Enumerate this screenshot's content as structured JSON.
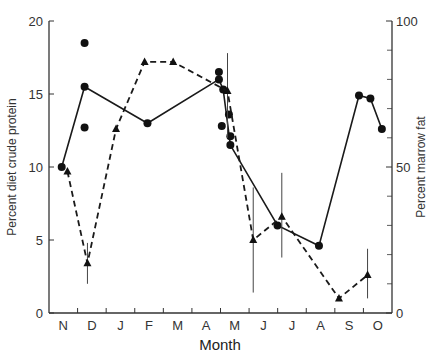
{
  "chart_data": {
    "type": "line",
    "title": "",
    "xlabel": "Month",
    "ylabel_left": "Percent diet crude protein",
    "ylabel_right": "Percent marrow fat",
    "ylim_left": [
      0,
      20
    ],
    "ylim_right": [
      0,
      100
    ],
    "yticks_left": [
      0,
      5,
      10,
      15,
      20
    ],
    "yticks_right": [
      0,
      50,
      100
    ],
    "yticks_right_minor": [
      10,
      20,
      30,
      40,
      60,
      70,
      80,
      90
    ],
    "categories": [
      "N",
      "D",
      "J",
      "F",
      "M",
      "A",
      "M",
      "J",
      "J",
      "A",
      "S",
      "O"
    ],
    "grid": false,
    "legend": "none",
    "series": [
      {
        "name": "Percent diet crude protein",
        "axis": "left",
        "style": "solid",
        "marker": "circle",
        "points": [
          {
            "month": "N",
            "x": 0.2,
            "y": 10.0
          },
          {
            "month": "D",
            "x": 1.0,
            "y": 15.5
          },
          {
            "month": "F",
            "x": 3.2,
            "y": 13.0
          },
          {
            "month": "M",
            "x": 5.7,
            "y": 16.0
          },
          {
            "month": "M",
            "x": 5.85,
            "y": 15.3
          },
          {
            "month": "M",
            "x": 6.1,
            "y": 11.5
          },
          {
            "month": "J",
            "x": 7.75,
            "y": 6.0
          },
          {
            "month": "A",
            "x": 9.2,
            "y": 4.6
          },
          {
            "month": "S",
            "x": 10.6,
            "y": 14.9
          },
          {
            "month": "O",
            "x": 11.0,
            "y": 14.7
          },
          {
            "month": "O",
            "x": 11.4,
            "y": 12.6
          }
        ],
        "extra_points": [
          {
            "month": "D",
            "x": 1.0,
            "y": 18.5
          },
          {
            "month": "D",
            "x": 1.0,
            "y": 12.7
          },
          {
            "month": "M",
            "x": 5.7,
            "y": 16.5
          },
          {
            "month": "M",
            "x": 5.8,
            "y": 12.8
          },
          {
            "month": "M",
            "x": 6.05,
            "y": 13.6
          },
          {
            "month": "M",
            "x": 6.1,
            "y": 12.1
          }
        ]
      },
      {
        "name": "Percent marrow fat",
        "axis": "right",
        "style": "dashed",
        "marker": "triangle",
        "points": [
          {
            "month": "N",
            "x": 0.4,
            "y": 48.5,
            "err": null
          },
          {
            "month": "D",
            "x": 1.1,
            "y": 17,
            "err": [
              10,
              24
            ]
          },
          {
            "month": "J",
            "x": 2.1,
            "y": 63,
            "err": null
          },
          {
            "month": "F",
            "x": 3.1,
            "y": 86,
            "err": null
          },
          {
            "month": "M",
            "x": 4.1,
            "y": 86,
            "err": null
          },
          {
            "month": "M",
            "x": 6.0,
            "y": 76,
            "err": [
              60,
              89
            ]
          },
          {
            "month": "J",
            "x": 6.9,
            "y": 25,
            "err": [
              7,
              43
            ]
          },
          {
            "month": "J",
            "x": 7.9,
            "y": 33,
            "err": [
              19,
              48
            ]
          },
          {
            "month": "S",
            "x": 9.9,
            "y": 5,
            "err": null
          },
          {
            "month": "O",
            "x": 10.9,
            "y": 13,
            "err": [
              5,
              22
            ]
          }
        ]
      }
    ]
  },
  "axes": {
    "xlabel": "Month",
    "ylabel_left": "Percent diet crude protein",
    "ylabel_right": "Percent marrow fat"
  }
}
